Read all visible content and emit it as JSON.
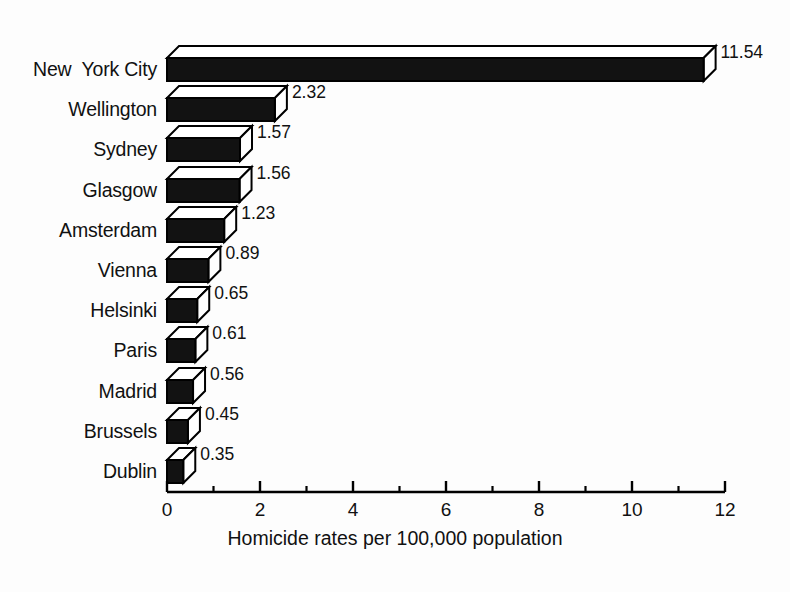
{
  "chart_data": {
    "type": "bar",
    "orientation": "horizontal",
    "title": "",
    "xlabel": "Homicide rates per 100,000 population",
    "ylabel": "",
    "xlim": [
      0,
      12
    ],
    "xticks": [
      0,
      2,
      4,
      6,
      8,
      10,
      12
    ],
    "xtick_labels": [
      "0",
      "2",
      "4",
      "6",
      "8",
      "10",
      "12"
    ],
    "minor_xticks": [
      1,
      3,
      5,
      7,
      9,
      11
    ],
    "grid": false,
    "legend": false,
    "style": "3d-extruded-bars",
    "bar_fill_color": "#121212",
    "bar_edge_color": "#000000",
    "bar_top_color": "#ffffff",
    "background_color": "#fdfdfd",
    "categories": [
      "New  York City",
      "Wellington",
      "Sydney",
      "Glasgow",
      "Amsterdam",
      "Vienna",
      "Helsinki",
      "Paris",
      "Madrid",
      "Brussels",
      "Dublin"
    ],
    "values": [
      11.54,
      2.32,
      1.57,
      1.56,
      1.23,
      0.89,
      0.65,
      0.61,
      0.56,
      0.45,
      0.35
    ],
    "value_labels": [
      "11.54",
      "2.32",
      "1.57",
      "1.56",
      "1.23",
      "0.89",
      "0.65",
      "0.61",
      "0.56",
      "0.45",
      "0.35"
    ]
  }
}
